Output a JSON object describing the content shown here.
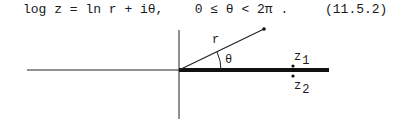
{
  "equation": {
    "lhs": "log z = ln r + iθ,",
    "condition": "0 ≤ θ < 2π .",
    "number": "(11.5.2)"
  },
  "figure": {
    "labels": {
      "radius": "r",
      "angle": "θ",
      "z1_base": "z",
      "z1_sub": "1",
      "z2_base": "z",
      "z2_sub": "2"
    }
  }
}
